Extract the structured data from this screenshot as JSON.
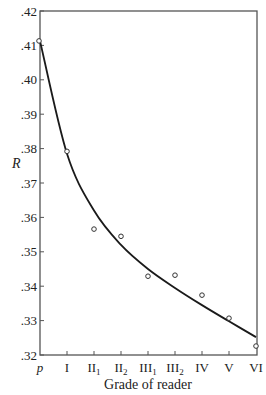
{
  "chart_data": {
    "type": "scatter",
    "title": "",
    "xlabel": "Grade of reader",
    "ylabel": "R",
    "categories": [
      "p",
      "I",
      "II1",
      "II2",
      "III1",
      "III2",
      "IV",
      "V",
      "VI"
    ],
    "category_display": [
      {
        "main": "p",
        "sub": ""
      },
      {
        "main": "I",
        "sub": ""
      },
      {
        "main": "II",
        "sub": "1"
      },
      {
        "main": "II",
        "sub": "2"
      },
      {
        "main": "III",
        "sub": "1"
      },
      {
        "main": "III",
        "sub": "2"
      },
      {
        "main": "IV",
        "sub": ""
      },
      {
        "main": "V",
        "sub": ""
      },
      {
        "main": "VI",
        "sub": ""
      }
    ],
    "series": [
      {
        "name": "Observed R",
        "style": "open circles",
        "values": [
          0.4113,
          0.3792,
          0.3566,
          0.3545,
          0.3429,
          0.3432,
          0.3374,
          0.3307,
          0.3226
        ]
      },
      {
        "name": "Fitted curve",
        "style": "solid line",
        "values": [
          0.4113,
          0.3785,
          0.362,
          0.352,
          0.345,
          0.3395,
          0.3345,
          0.3298,
          0.3252
        ]
      }
    ],
    "yticks": [
      0.32,
      0.33,
      0.34,
      0.35,
      0.36,
      0.37,
      0.38,
      0.39,
      0.4,
      0.41,
      0.42
    ],
    "ytick_labels": [
      ".32",
      ".33",
      ".34",
      ".35",
      ".36",
      ".37",
      ".38",
      ".39",
      ".40",
      ".41",
      ".42"
    ],
    "ylim": [
      0.32,
      0.42
    ],
    "grid": false,
    "legend": "none",
    "frame": "box"
  },
  "axis": {
    "x_title": "Grade of reader",
    "y_title": "R"
  },
  "colors": {
    "line": "#1a1a1a",
    "frame": "#444444",
    "marker_edge": "#333333",
    "background": "#ffffff"
  }
}
